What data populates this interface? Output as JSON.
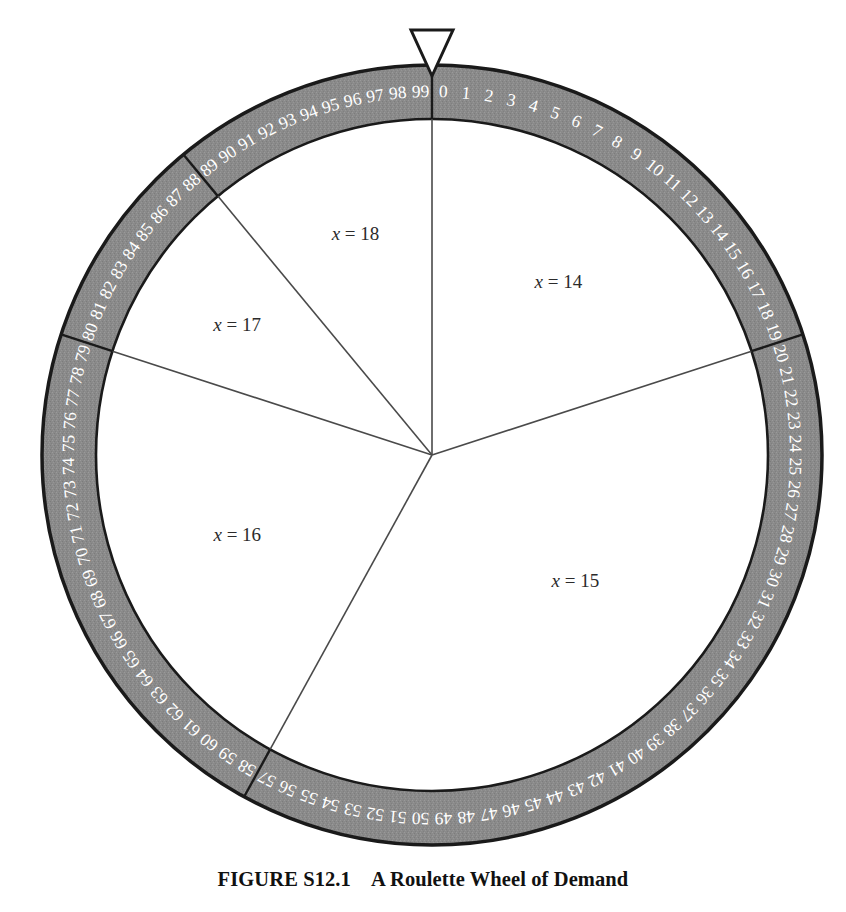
{
  "figure": {
    "caption_label": "FIGURE S12.1",
    "caption_title": "A Roulette Wheel of Demand"
  },
  "wheel": {
    "pointer_icon": "pointer-triangle-icon",
    "rim_color": "#8a8a8a",
    "rim_edge_color": "#1a1a1a",
    "rim_number_color": "#ffffff",
    "face_color": "#ffffff",
    "spoke_color": "#4a4a4a",
    "label_color": "#2b2b2b",
    "slot_count": 100,
    "first_slot": 0,
    "last_slot": 99,
    "rim_numbers": [
      "0",
      "1",
      "2",
      "3",
      "4",
      "5",
      "6",
      "7",
      "8",
      "9",
      "10",
      "11",
      "12",
      "13",
      "14",
      "15",
      "16",
      "17",
      "18",
      "19",
      "20",
      "21",
      "22",
      "23",
      "24",
      "25",
      "26",
      "27",
      "28",
      "29",
      "30",
      "31",
      "32",
      "33",
      "34",
      "35",
      "36",
      "37",
      "38",
      "39",
      "40",
      "41",
      "42",
      "43",
      "44",
      "45",
      "46",
      "47",
      "48",
      "49",
      "50",
      "51",
      "52",
      "53",
      "54",
      "55",
      "56",
      "57",
      "58",
      "59",
      "60",
      "61",
      "62",
      "63",
      "64",
      "65",
      "66",
      "67",
      "68",
      "69",
      "70",
      "71",
      "72",
      "73",
      "74",
      "75",
      "76",
      "77",
      "78",
      "79",
      "80",
      "81",
      "82",
      "83",
      "84",
      "85",
      "86",
      "87",
      "88",
      "89",
      "90",
      "91",
      "92",
      "93",
      "94",
      "95",
      "96",
      "97",
      "98",
      "99"
    ]
  },
  "chart_data": {
    "type": "pie",
    "title": "A Roulette Wheel of Demand",
    "xlabel": "",
    "ylabel": "",
    "units": "slots out of 100",
    "legend_position": "inside-slices",
    "grid": false,
    "categories": [
      "x = 14",
      "x = 15",
      "x = 16",
      "x = 17",
      "x = 18"
    ],
    "values": [
      20,
      38,
      22,
      9,
      11
    ],
    "slices": [
      {
        "label": "x = 14",
        "variable": "x",
        "value": 14,
        "slots": 20,
        "probability": 0.2,
        "start_slot": 0,
        "end_slot": 19,
        "start_deg": 0,
        "end_deg": 72,
        "label_r": 215,
        "label_deg": 36
      },
      {
        "label": "x = 15",
        "variable": "x",
        "value": 15,
        "slots": 38,
        "probability": 0.38,
        "start_slot": 20,
        "end_slot": 57,
        "start_deg": 72,
        "end_deg": 208.8,
        "label_r": 190,
        "label_deg": 131
      },
      {
        "label": "x = 16",
        "variable": "x",
        "value": 16,
        "slots": 22,
        "probability": 0.22,
        "start_slot": 58,
        "end_slot": 79,
        "start_deg": 208.8,
        "end_deg": 288,
        "label_r": 210,
        "label_deg": 248
      },
      {
        "label": "x = 17",
        "variable": "x",
        "value": 17,
        "slots": 9,
        "probability": 0.09,
        "start_slot": 80,
        "end_slot": 88,
        "start_deg": 288,
        "end_deg": 320.4,
        "label_r": 235,
        "label_deg": 304
      },
      {
        "label": "x = 18",
        "variable": "x",
        "value": 18,
        "slots": 11,
        "probability": 0.11,
        "start_slot": 89,
        "end_slot": 99,
        "start_deg": 320.4,
        "end_deg": 360,
        "label_r": 235,
        "label_deg": 341
      }
    ]
  }
}
